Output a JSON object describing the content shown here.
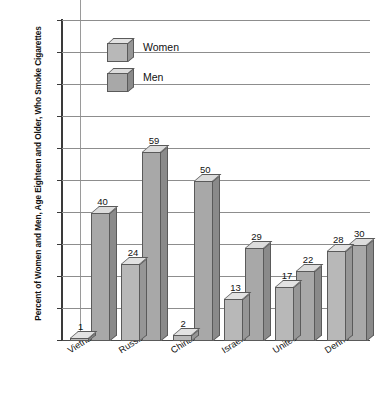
{
  "chart_data": {
    "type": "bar",
    "title": "",
    "xlabel": "",
    "ylabel": "Percent of Women and Men, Age Eighteen and Older, Who Smoke Cigarettes",
    "ylim": [
      0,
      100
    ],
    "ytick_step": 10,
    "yticks": [
      100,
      90,
      80,
      70,
      60,
      50,
      40,
      30,
      20,
      10,
      0
    ],
    "grid": "horizontal",
    "legend_position": "top-left-inside",
    "style": "3d-clustered-column",
    "categories": [
      "Vietnam",
      "Russia",
      "China",
      "Israel",
      "United States",
      "Denmark"
    ],
    "series": [
      {
        "name": "Women",
        "values": [
          1,
          24,
          2,
          13,
          17,
          28
        ],
        "color": "#b8b8b8"
      },
      {
        "name": "Men",
        "values": [
          40,
          59,
          50,
          29,
          22,
          30
        ],
        "color": "#a8a8a8"
      }
    ]
  },
  "legend": {
    "items": [
      {
        "label": "Women"
      },
      {
        "label": "Men"
      }
    ]
  },
  "axis": {
    "y_title": "Percent of Women and Men, Age Eighteen and Older, Who Smoke Cigarettes"
  }
}
